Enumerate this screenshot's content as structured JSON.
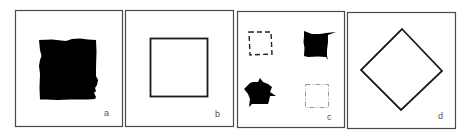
{
  "figure": {
    "panel_count": 4,
    "colors": {
      "border": "#4a4a4a",
      "shape_fill": "#000000",
      "shape_stroke": "#1a1a1a",
      "faint_stroke": "#9a9a9a",
      "label": "#555555",
      "background": "#ffffff"
    },
    "panels": [
      {
        "id": "a",
        "label": "a",
        "content": "irregular filled black square blob"
      },
      {
        "id": "b",
        "label": "b",
        "content": "outlined square"
      },
      {
        "id": "c",
        "label": "c",
        "content": "four variants: dashed square, filled square with tail, jagged filled star-like blob, faint dashed square"
      },
      {
        "id": "d",
        "label": "d",
        "content": "outlined diamond (square rotated 45 degrees)"
      }
    ]
  }
}
